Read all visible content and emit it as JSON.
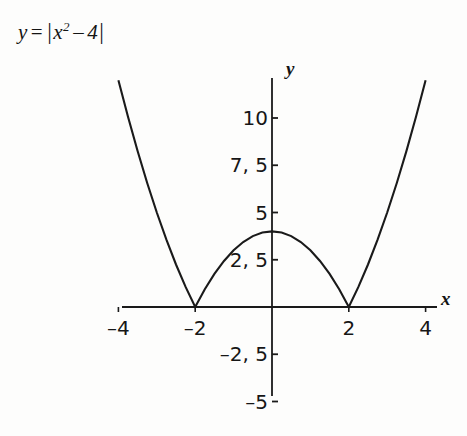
{
  "equation": {
    "lhs": "y",
    "equals": "=",
    "open_bar": "|",
    "base": "x",
    "exponent": "2",
    "minus": "–",
    "constant": "4",
    "close_bar": "|",
    "full_text": "y = |x² – 4|"
  },
  "axes": {
    "x_name": "x",
    "y_name": "y"
  },
  "chart_data": {
    "type": "line",
    "xlabel": "x",
    "ylabel": "y",
    "grid": false,
    "legend": "none",
    "xlim": [
      -4.2,
      4.2
    ],
    "ylim": [
      -5.5,
      12.4
    ],
    "x_ticks": [
      {
        "value": -4,
        "label": "–4"
      },
      {
        "value": -2,
        "label": "–2"
      },
      {
        "value": 2,
        "label": "2"
      },
      {
        "value": 4,
        "label": "4"
      }
    ],
    "y_ticks": [
      {
        "value": 10,
        "label": "10"
      },
      {
        "value": 7.5,
        "label": "7, 5"
      },
      {
        "value": 5,
        "label": "5"
      },
      {
        "value": 2.5,
        "label": "2, 5"
      },
      {
        "value": -2.5,
        "label": "–2, 5"
      },
      {
        "value": -5,
        "label": "–5"
      }
    ],
    "series": [
      {
        "name": "y = |x² – 4|",
        "color": "#1a1a1a",
        "x": [
          -4,
          -3.75,
          -3.5,
          -3.25,
          -3,
          -2.75,
          -2.5,
          -2.25,
          -2,
          -1.75,
          -1.5,
          -1.25,
          -1,
          -0.75,
          -0.5,
          -0.25,
          0,
          0.25,
          0.5,
          0.75,
          1,
          1.25,
          1.5,
          1.75,
          2,
          2.25,
          2.5,
          2.75,
          3,
          3.25,
          3.5,
          3.75,
          4
        ],
        "y": [
          12,
          10.0625,
          8.25,
          6.5625,
          5,
          3.5625,
          2.25,
          1.0625,
          0,
          0.9375,
          1.75,
          2.4375,
          3,
          3.4375,
          3.75,
          3.9375,
          4,
          3.9375,
          3.75,
          3.4375,
          3,
          2.4375,
          1.75,
          0.9375,
          0,
          1.0625,
          2.25,
          3.5625,
          5,
          6.5625,
          8.25,
          10.0625,
          12
        ]
      }
    ],
    "key_points": [
      {
        "label": "vertex",
        "x": 0,
        "y": 4
      },
      {
        "label": "cusp-left",
        "x": -2,
        "y": 0
      },
      {
        "label": "cusp-right",
        "x": 2,
        "y": 0
      }
    ]
  }
}
